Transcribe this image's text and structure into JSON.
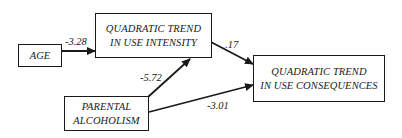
{
  "diagram": {
    "nodes": {
      "age": {
        "lines": [
          "AGE"
        ]
      },
      "intensity": {
        "lines": [
          "QUADRATIC TREND",
          "IN USE INTENSITY"
        ]
      },
      "consequences": {
        "lines": [
          "QUADRATIC TREND",
          "IN USE CONSEQUENCES"
        ]
      },
      "parental": {
        "lines": [
          "PARENTAL",
          "ALCOHOLISM"
        ]
      }
    },
    "edges": {
      "age_to_intensity": {
        "from": "AGE",
        "to": "QUADRATIC TREND IN USE INTENSITY",
        "coefficient": "-3.28"
      },
      "intensity_to_consequences": {
        "from": "QUADRATIC TREND IN USE INTENSITY",
        "to": "QUADRATIC TREND IN USE CONSEQUENCES",
        "coefficient": ".17"
      },
      "parental_to_intensity": {
        "from": "PARENTAL ALCOHOLISM",
        "to": "QUADRATIC TREND IN USE INTENSITY",
        "coefficient": "-5.72"
      },
      "parental_to_consequences": {
        "from": "PARENTAL ALCOHOLISM",
        "to": "QUADRATIC TREND IN USE CONSEQUENCES",
        "coefficient": "-3.01"
      }
    }
  }
}
